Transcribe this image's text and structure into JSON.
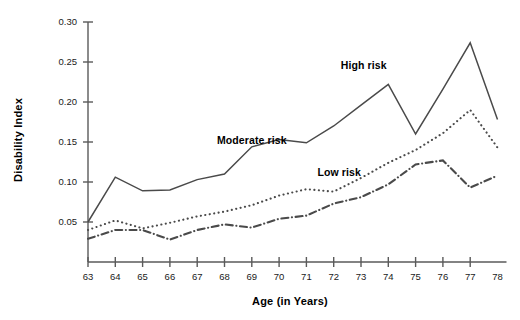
{
  "chart_data": {
    "type": "line",
    "title": "",
    "xlabel": "Age (in Years)",
    "ylabel": "Disability Index",
    "x": [
      63,
      64,
      65,
      66,
      67,
      68,
      69,
      70,
      71,
      72,
      73,
      74,
      75,
      76,
      77,
      78
    ],
    "xticklabels": [
      "63",
      "64",
      "65",
      "66",
      "67",
      "68",
      "69",
      "70",
      "71",
      "72",
      "73",
      "74",
      "75",
      "76",
      "77",
      "78"
    ],
    "yticklabels": [
      "0.05",
      "0.10",
      "0.15",
      "0.20",
      "0.25",
      "0.30"
    ],
    "ytickvalues": [
      0.05,
      0.1,
      0.15,
      0.2,
      0.25,
      0.3
    ],
    "xlim": [
      63,
      78
    ],
    "ylim": [
      0.0,
      0.3
    ],
    "grid": false,
    "legend_position": "inline-annotations",
    "series": [
      {
        "name": "High risk",
        "style": "solid",
        "color": "#4a4a4a",
        "values": [
          0.05,
          0.106,
          0.089,
          0.09,
          0.103,
          0.11,
          0.144,
          0.153,
          0.149,
          0.17,
          0.196,
          0.222,
          0.16,
          0.216,
          0.274,
          0.178
        ]
      },
      {
        "name": "Moderate risk",
        "style": "dotted",
        "color": "#4a4a4a",
        "values": [
          0.04,
          0.052,
          0.042,
          0.049,
          0.057,
          0.063,
          0.071,
          0.083,
          0.091,
          0.088,
          0.105,
          0.124,
          0.14,
          0.161,
          0.19,
          0.143
        ]
      },
      {
        "name": "Low risk",
        "style": "dash-dot",
        "color": "#4a4a4a",
        "values": [
          0.029,
          0.04,
          0.04,
          0.028,
          0.04,
          0.047,
          0.043,
          0.054,
          0.058,
          0.073,
          0.081,
          0.097,
          0.122,
          0.127,
          0.093,
          0.108
        ]
      }
    ],
    "annotations": [
      {
        "text": "High risk",
        "x_data": 73.1,
        "y_data": 0.241
      },
      {
        "text": "Moderate risk",
        "x_data": 69.0,
        "y_data": 0.147
      },
      {
        "text": "Low risk",
        "x_data": 72.2,
        "y_data": 0.108
      }
    ]
  }
}
